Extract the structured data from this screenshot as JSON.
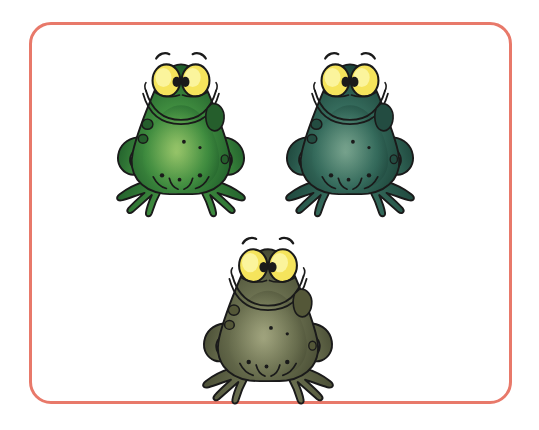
{
  "scene": {
    "title": "Three cartoon frogs illustration",
    "background_color": "#ffffff",
    "caption": ""
  },
  "frame": {
    "name": "rounded-rectangle-border",
    "border_color": "#e8796a",
    "border_width_px": 3,
    "corner_radius_px": 22,
    "x": 29,
    "y": 22,
    "width": 483,
    "height": 382,
    "fill": "#ffffff"
  },
  "illustration": {
    "subject": "frog",
    "count": 3,
    "style": "cartoon clip-art, black ink outline, airbrush gradient fill",
    "shared_features": {
      "eye_color": "#f5e45c",
      "eye_highlight_color": "#fbf49c",
      "pupil_color": "#1a1a1a",
      "outline_color": "#1a1a1a",
      "eyebrow_color": "#1a1a1a",
      "mouth": "wide smile",
      "pose": "sitting front-facing, webbed feet splayed"
    },
    "frogs": [
      {
        "id": "frog-1",
        "label": "green frog",
        "position": "top-left",
        "x": 108,
        "y": 48,
        "width": 146,
        "height": 170,
        "body_light": "#8cbf63",
        "body_mid": "#3f8c3f",
        "body_dark": "#1f5c2a",
        "spot_color": "#255e2c",
        "belly_light": "#a9cf72"
      },
      {
        "id": "frog-2",
        "label": "teal green frog",
        "position": "top-right",
        "x": 277,
        "y": 48,
        "width": 146,
        "height": 170,
        "body_light": "#6f9c86",
        "body_mid": "#356b5c",
        "body_dark": "#1c4339",
        "spot_color": "#234c41",
        "belly_light": "#84ad97"
      },
      {
        "id": "frog-3",
        "label": "olive gray frog",
        "position": "bottom-center",
        "x": 192,
        "y": 233,
        "width": 152,
        "height": 172,
        "body_light": "#9a9e77",
        "body_mid": "#6b7050",
        "body_dark": "#474b33",
        "spot_color": "#545738",
        "belly_light": "#abae88"
      }
    ]
  }
}
